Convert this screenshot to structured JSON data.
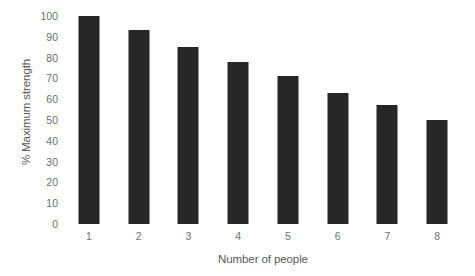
{
  "chart_data": {
    "type": "bar",
    "title": "",
    "subtitle": "",
    "xlabel": "Number of people",
    "ylabel": "% Maximum strength",
    "categories": [
      "1",
      "2",
      "3",
      "4",
      "5",
      "6",
      "7",
      "8"
    ],
    "values": [
      100,
      93.5,
      85,
      78,
      71,
      63,
      57,
      50
    ],
    "series": [
      {
        "name": "% Maximum strength",
        "values": [
          100,
          93.5,
          85,
          78,
          71,
          63,
          57,
          50
        ]
      }
    ],
    "ylim": [
      0,
      100
    ],
    "ytick_labels": [
      "100",
      "90",
      "80",
      "70",
      "60",
      "50",
      "40",
      "30",
      "20",
      "10",
      "0"
    ],
    "ytick_values": [
      100,
      90,
      80,
      70,
      60,
      50,
      40,
      30,
      20,
      10,
      0
    ],
    "xtick_labels": [
      "1",
      "2",
      "3",
      "4",
      "5",
      "6",
      "7",
      "8"
    ],
    "grid": false,
    "legend": false,
    "legend_position": "none",
    "annotations": [],
    "colors": {
      "bar": "#262626",
      "background": "#ffffff",
      "tick_label": "#6d6e70",
      "axis_title": "#59595b"
    }
  }
}
